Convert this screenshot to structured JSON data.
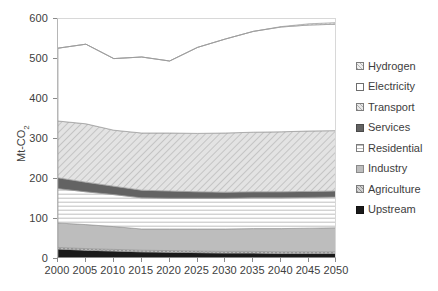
{
  "chart_data": {
    "type": "area",
    "stacked": true,
    "title": "",
    "xlabel": "",
    "ylabel": "Mt-CO2",
    "ylabel_display": "Mt-CO",
    "ylabel_sub": "2",
    "x": [
      2000,
      2005,
      2010,
      2015,
      2020,
      2025,
      2030,
      2035,
      2040,
      2045,
      2050
    ],
    "xlim": [
      2000,
      2050
    ],
    "ylim": [
      0,
      600
    ],
    "ytick_values": [
      0,
      100,
      200,
      300,
      400,
      500,
      600
    ],
    "ytick_labels": [
      "0",
      "100",
      "200",
      "300",
      "400",
      "500",
      "600"
    ],
    "xtick_labels": [
      "2000",
      "2005",
      "2010",
      "2015",
      "2020",
      "2025",
      "2030",
      "2035",
      "2040",
      "2045",
      "2050"
    ],
    "grid": false,
    "legend_position": "right",
    "series": [
      {
        "name": "Upstream",
        "fill": "#1a1a1a",
        "pattern": "solid",
        "values": [
          25,
          22,
          20,
          18,
          17,
          16,
          15,
          15,
          14,
          14,
          14
        ]
      },
      {
        "name": "Agriculture",
        "fill": "#c9c9c9",
        "pattern": "cross-hatch",
        "values": [
          4,
          4,
          4,
          4,
          4,
          4,
          4,
          4,
          4,
          4,
          4
        ]
      },
      {
        "name": "Industry",
        "fill": "#bdbdbd",
        "pattern": "solid",
        "values": [
          61,
          60,
          57,
          53,
          54,
          55,
          56,
          57,
          58,
          59,
          60
        ]
      },
      {
        "name": "Residential",
        "fill": "#ffffff",
        "pattern": "horizontal-lines",
        "values": [
          86,
          82,
          80,
          78,
          77,
          77,
          77,
          77,
          77,
          77,
          77
        ]
      },
      {
        "name": "Services",
        "fill": "#636363",
        "pattern": "solid",
        "values": [
          27,
          24,
          21,
          19,
          18,
          16,
          15,
          15,
          15,
          15,
          15
        ]
      },
      {
        "name": "Transport",
        "fill": "#d6d6d6",
        "pattern": "diagonal-hatch",
        "values": [
          142,
          146,
          140,
          143,
          145,
          146,
          148,
          149,
          150,
          151,
          151
        ]
      },
      {
        "name": "Electricity",
        "fill": "#ffffff",
        "pattern": "none",
        "values": [
          182,
          199,
          179,
          190,
          180,
          215,
          235,
          252,
          262,
          265,
          266
        ]
      },
      {
        "name": "Hydrogen",
        "fill": "#d0d0d0",
        "pattern": "fine-hatch",
        "values": [
          0,
          0,
          0,
          0,
          0,
          0,
          0,
          0,
          1,
          3,
          4
        ]
      }
    ],
    "stack_top_totals": [
      527,
      537,
      501,
      505,
      495,
      529,
      550,
      569,
      581,
      588,
      591
    ],
    "legend_order": [
      "Hydrogen",
      "Electricity",
      "Transport",
      "Services",
      "Residential",
      "Industry",
      "Agriculture",
      "Upstream"
    ]
  },
  "legend": {
    "items": [
      {
        "label": "Hydrogen",
        "swatch": "fine-hatch"
      },
      {
        "label": "Electricity",
        "swatch": "none"
      },
      {
        "label": "Transport",
        "swatch": "diagonal-hatch"
      },
      {
        "label": "Services",
        "swatch": "solid-dark"
      },
      {
        "label": "Residential",
        "swatch": "horizontal-lines"
      },
      {
        "label": "Industry",
        "swatch": "solid-light"
      },
      {
        "label": "Agriculture",
        "swatch": "cross-hatch"
      },
      {
        "label": "Upstream",
        "swatch": "solid-black"
      }
    ]
  },
  "colors": {
    "upstream": "#1a1a1a",
    "services": "#636363",
    "industry": "#bdbdbd",
    "transport": "#d6d6d6",
    "axis": "#888888",
    "text": "#404040"
  }
}
